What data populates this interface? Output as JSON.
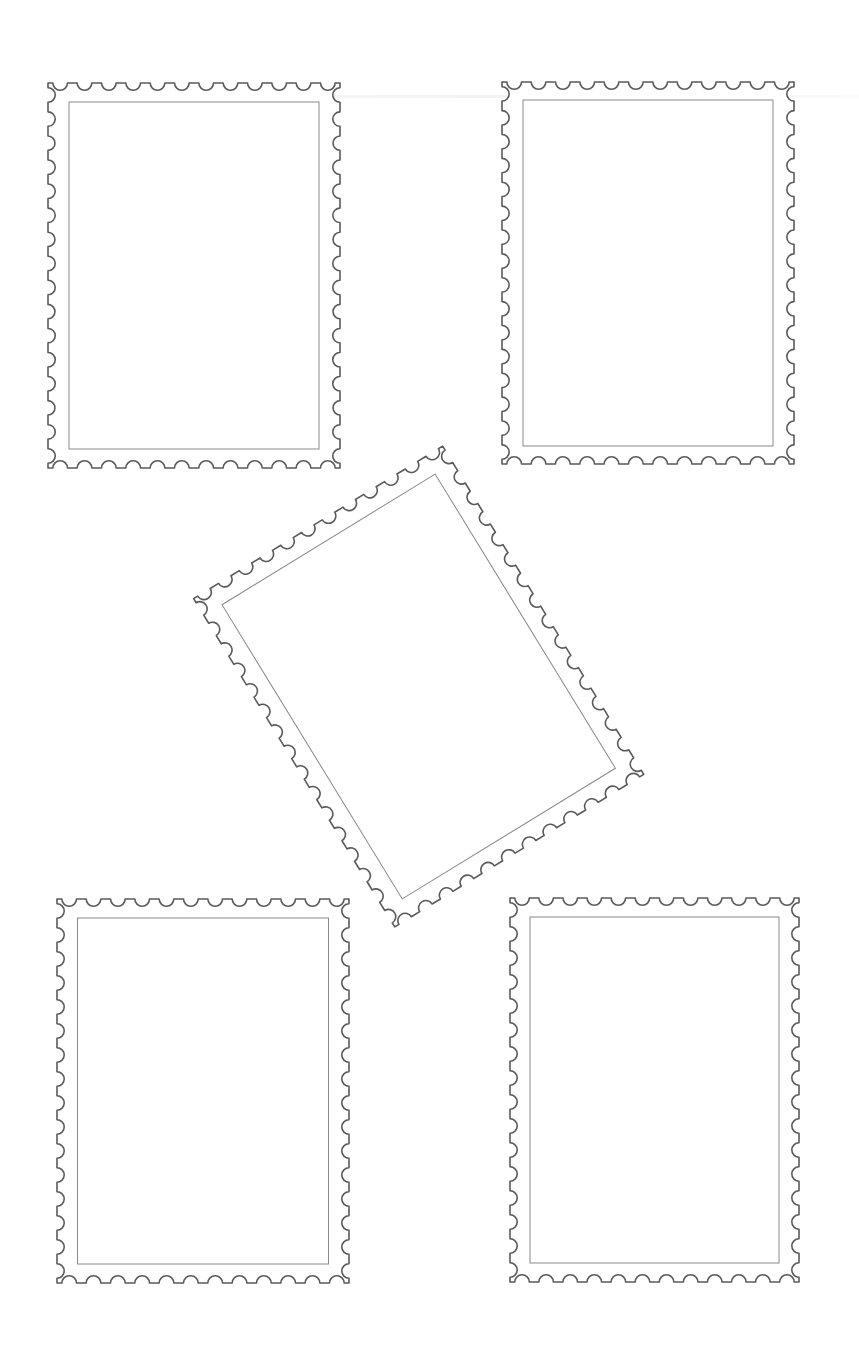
{
  "page": {
    "width": 859,
    "height": 1368,
    "background": "#ffffff",
    "outline_color": "#5a5a5a",
    "inner_color": "#8a8a8a"
  },
  "stamps": [
    {
      "name": "stamp-top-left",
      "cx": 194,
      "cy": 275.5,
      "outer_w": 292,
      "outer_h": 385,
      "inner_w": 250,
      "inner_h": 347,
      "rotation": 0,
      "teeth_h": 12,
      "teeth_v": 16
    },
    {
      "name": "stamp-top-right",
      "cx": 648,
      "cy": 273,
      "outer_w": 292,
      "outer_h": 382,
      "inner_w": 250,
      "inner_h": 346,
      "rotation": 0,
      "teeth_h": 12,
      "teeth_v": 16
    },
    {
      "name": "stamp-center-tilted",
      "cx": 418.7,
      "cy": 686.5,
      "outer_w": 292,
      "outer_h": 385,
      "inner_w": 250,
      "inner_h": 345,
      "rotation": -31.5,
      "teeth_h": 12,
      "teeth_v": 16
    },
    {
      "name": "stamp-bottom-left",
      "cx": 203,
      "cy": 1091,
      "outer_w": 292,
      "outer_h": 384,
      "inner_w": 251,
      "inner_h": 346,
      "rotation": 0,
      "teeth_h": 12,
      "teeth_v": 16
    },
    {
      "name": "stamp-bottom-right",
      "cx": 654.5,
      "cy": 1090,
      "outer_w": 289,
      "outer_h": 384,
      "inner_w": 249,
      "inner_h": 346,
      "rotation": 0,
      "teeth_h": 12,
      "teeth_v": 16
    }
  ]
}
